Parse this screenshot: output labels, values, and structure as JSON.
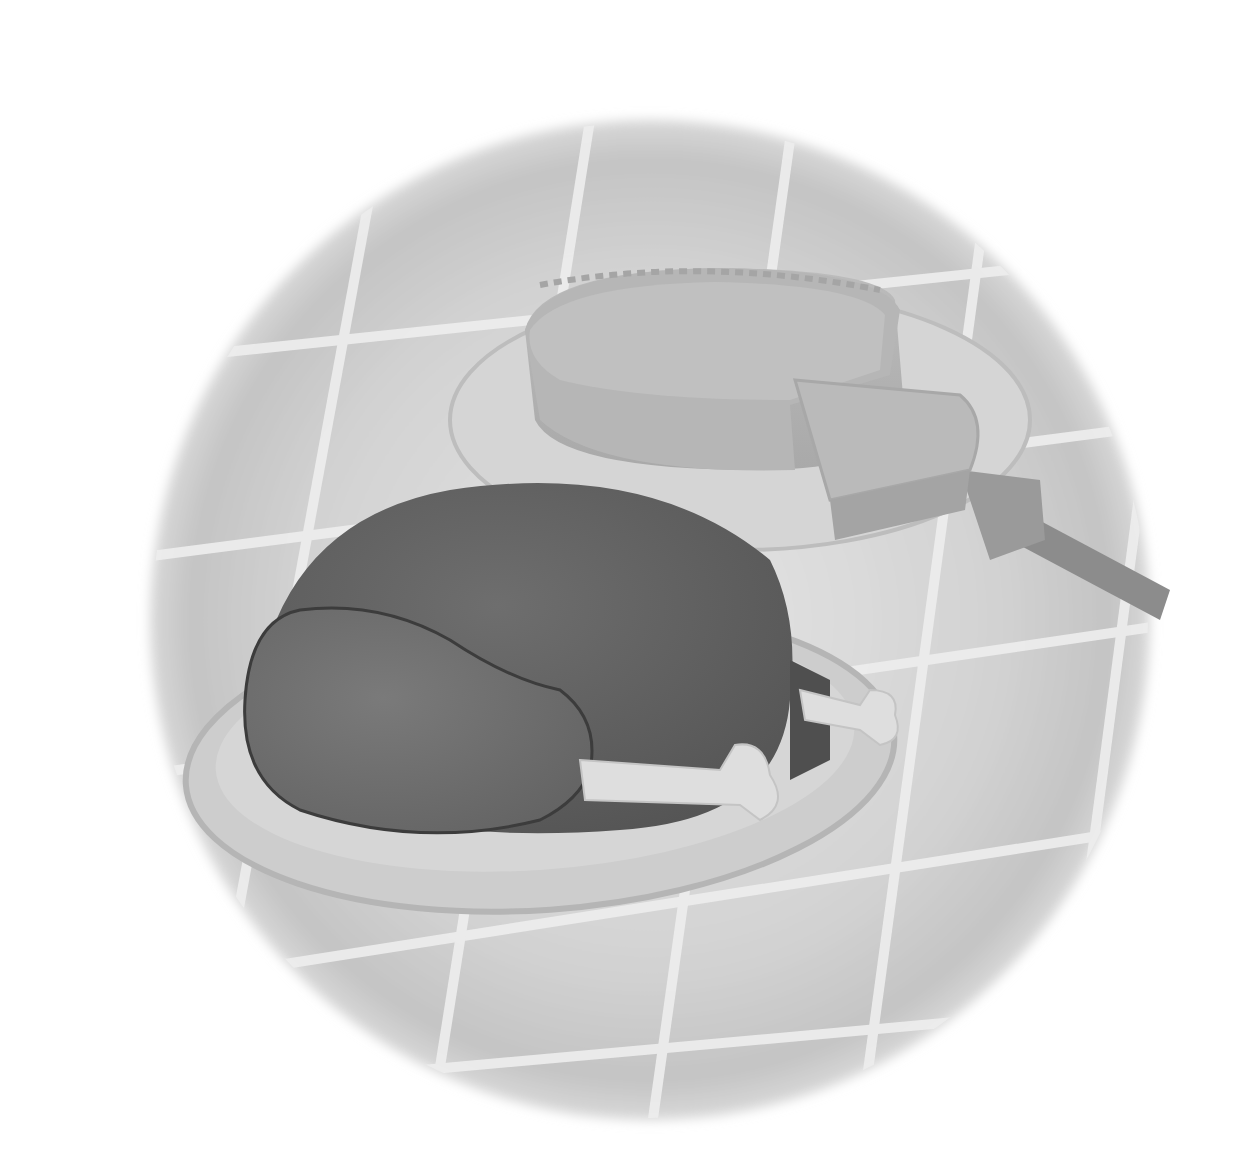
{
  "image": {
    "description": "Grayscale illustration of a holiday meal: a roast turkey on an oval platter in the foreground and a pie with one slice lifted on a pie server behind it, set on a tiled tablecloth within a soft circular vignette.",
    "style": "grayscale painted illustration",
    "subjects": [
      {
        "name": "roast-turkey",
        "label": "Roast turkey"
      },
      {
        "name": "turkey-platter",
        "label": "Oval platter"
      },
      {
        "name": "pie",
        "label": "Pie with slice removed"
      },
      {
        "name": "pie-slice",
        "label": "Lifted pie slice"
      },
      {
        "name": "pie-server",
        "label": "Pie server"
      },
      {
        "name": "pie-plate",
        "label": "Pie plate"
      },
      {
        "name": "tablecloth",
        "label": "Tiled tablecloth"
      }
    ]
  },
  "colors": {
    "background": "#ffffff",
    "vignette": "#c9c9c9",
    "vignette_light": "#e4e4e4",
    "grid_lines": "#efefef",
    "turkey_dark": "#5f5f5f",
    "turkey_mid": "#707070",
    "turkey_outline": "#3c3c3c",
    "bone": "#dcdcdc",
    "platter": "#cfcfcf",
    "platter_rim": "#b9b9b9",
    "pie_top": "#bdbdbd",
    "pie_side": "#b2b2b2",
    "pie_plate": "#d6d6d6",
    "server": "#8a8a8a"
  }
}
